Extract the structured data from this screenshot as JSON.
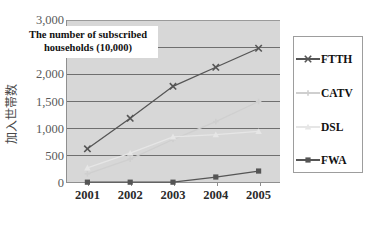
{
  "chart_data": {
    "type": "line",
    "title": "The number of subscribed households (10,000)",
    "xlabel": "",
    "ylabel": "加入世帯数",
    "categories": [
      "2001",
      "2002",
      "2003",
      "2004",
      "2005"
    ],
    "ylim": [
      0,
      3000
    ],
    "ytick_labels": [
      "0",
      "500",
      "1,000",
      "1,500",
      "2,000",
      "2,500",
      "3,000"
    ],
    "ytick_values": [
      0,
      500,
      1000,
      1500,
      2000,
      2500,
      3000
    ],
    "grid": true,
    "legend_position": "right",
    "series": [
      {
        "name": "FTTH",
        "values": [
          630,
          1190,
          1780,
          2130,
          2480
        ],
        "color": "#555555",
        "marker": "x"
      },
      {
        "name": "CATV",
        "values": [
          170,
          440,
          800,
          1130,
          1500
        ],
        "color": "#cfcfcf",
        "marker": "plus"
      },
      {
        "name": "DSL",
        "values": [
          280,
          550,
          850,
          890,
          950
        ],
        "color": "#e6e6e6",
        "marker": "triangle"
      },
      {
        "name": "FWA",
        "values": [
          15,
          15,
          15,
          110,
          220
        ],
        "color": "#555555",
        "marker": "square"
      }
    ]
  },
  "plot": {
    "background_color": "#d7d7d7",
    "gridline_color": "#6f6f6f",
    "axis_color": "#8f8f8f"
  },
  "legend": {
    "border_color": "#9d9d9d",
    "background_color": "#ffffff"
  }
}
